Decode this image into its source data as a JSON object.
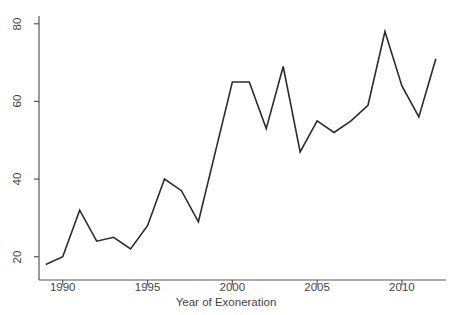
{
  "chart_data": {
    "type": "line",
    "title": "",
    "xlabel": "Year of Exoneration",
    "ylabel": "Exonerations",
    "x": [
      1989,
      1990,
      1991,
      1992,
      1993,
      1994,
      1995,
      1996,
      1997,
      1998,
      1999,
      2000,
      2001,
      2002,
      2003,
      2004,
      2005,
      2006,
      2007,
      2008,
      2009,
      2010,
      2011,
      2012
    ],
    "values": [
      18,
      20,
      32,
      24,
      25,
      22,
      28,
      40,
      37,
      29,
      47,
      65,
      65,
      53,
      69,
      47,
      55,
      52,
      55,
      59,
      78,
      64,
      56,
      71
    ],
    "series": [
      {
        "name": "Exonerations",
        "values": [
          18,
          20,
          32,
          24,
          25,
          22,
          28,
          40,
          37,
          29,
          47,
          65,
          65,
          53,
          69,
          47,
          55,
          52,
          55,
          59,
          78,
          64,
          56,
          71
        ]
      }
    ],
    "xlim": [
      1988.6,
      2012.6
    ],
    "ylim": [
      14,
      82
    ],
    "xticks": [
      1990,
      1995,
      2000,
      2005,
      2010
    ],
    "xtick_labels": [
      "1990",
      "1995",
      "2000",
      "2005",
      "2010"
    ],
    "yticks": [
      20,
      40,
      60,
      80
    ],
    "ytick_labels": [
      "20",
      "40",
      "60",
      "80"
    ],
    "grid": false,
    "legend": false,
    "line_color": "#2b2b2b",
    "axis_color": "#555555",
    "background": "#ffffff"
  }
}
